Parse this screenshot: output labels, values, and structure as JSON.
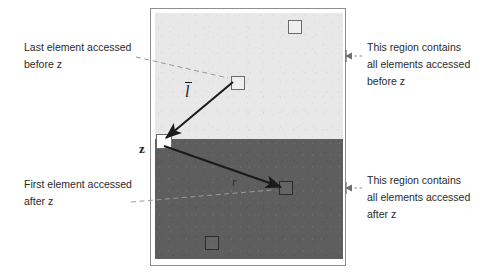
{
  "figure": {
    "type": "diagram",
    "colors": {
      "upper_region_fill": "#e8e8e8",
      "lower_region_fill": "#5e5e5e",
      "frame_border": "#8e8e8e",
      "arrow": "#1b1b1b",
      "leader_line": "#8a8a8a",
      "text": "#2a2a2a",
      "page_background": "#ffffff"
    },
    "regions": [
      {
        "id": "upper",
        "label_ref": "note_top_right",
        "shade": "light"
      },
      {
        "id": "lower",
        "label_ref": "note_bottom_right",
        "shade": "dark"
      }
    ],
    "elements": [
      {
        "id": "el-top-right",
        "region": "upper",
        "note": "unlabelled element in light region"
      },
      {
        "id": "el-last-before",
        "region": "upper",
        "note": "last element accessed before z"
      },
      {
        "id": "el-z",
        "region": "boundary",
        "label": "z"
      },
      {
        "id": "el-first-after",
        "region": "lower",
        "note": "first element accessed after z"
      },
      {
        "id": "el-bottom-left",
        "region": "lower",
        "note": "unlabelled element in dark region"
      }
    ],
    "vectors": [
      {
        "id": "vector-l",
        "label": "l",
        "accent": "bar",
        "from": "el-last-before",
        "to": "el-z",
        "direction": "toward z"
      },
      {
        "id": "vector-r",
        "label": "r",
        "accent": "none",
        "from": "el-z",
        "to": "el-first-after",
        "direction": "away from z"
      }
    ]
  },
  "labels": {
    "z": "z",
    "vector_l": "l",
    "vector_r": "r"
  },
  "notes": {
    "note_top_left": {
      "line1": "Last element accessed",
      "line2": "before z"
    },
    "note_bottom_left": {
      "line1": "First element accessed",
      "line2": "after z"
    },
    "note_top_right": {
      "line1": "This region contains",
      "line2": "all elements accessed",
      "line3": "before z"
    },
    "note_bottom_right": {
      "line1": "This region contains",
      "line2": "all elements accessed",
      "line3": "after z"
    }
  }
}
